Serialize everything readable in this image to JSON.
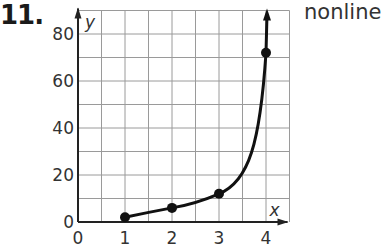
{
  "problem": {
    "number": "11.",
    "side_text": "nonline"
  },
  "chart_data": {
    "type": "line",
    "title": "",
    "xlabel": "x",
    "ylabel": "y",
    "x_ticks": [
      "0",
      "1",
      "2",
      "3",
      "4"
    ],
    "y_ticks": [
      "0",
      "20",
      "40",
      "60",
      "80"
    ],
    "xlim": [
      0,
      4.5
    ],
    "ylim": [
      0,
      90
    ],
    "grid": true,
    "grid_step": {
      "x": 0.5,
      "y": 10
    },
    "legend": null,
    "series": [
      {
        "name": "curve",
        "points": [
          {
            "x": 1,
            "y": 2
          },
          {
            "x": 2,
            "y": 6
          },
          {
            "x": 3,
            "y": 12
          },
          {
            "x": 4,
            "y": 72
          }
        ],
        "smooth": true,
        "arrow_end": true
      }
    ],
    "colors": {
      "line": "#111111",
      "grid": "#9a9a9a",
      "axis": "#222222"
    }
  }
}
